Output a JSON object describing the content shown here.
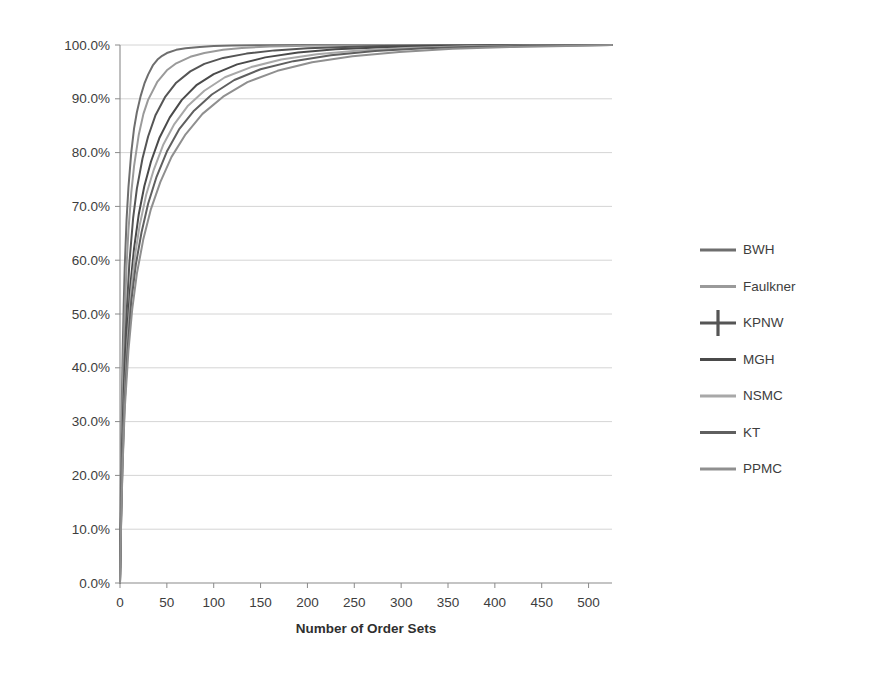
{
  "chart_data": {
    "type": "line",
    "title": "",
    "subtitle": "",
    "xlabel": "Number of Order Sets",
    "ylabel": "",
    "xlim": [
      0,
      525
    ],
    "ylim": [
      0,
      1.0
    ],
    "grid": "horizontal",
    "legend_position": "right",
    "x_ticks": [
      0,
      50,
      100,
      150,
      200,
      250,
      300,
      350,
      400,
      450,
      500
    ],
    "x_tick_labels": [
      "0",
      "50",
      "100",
      "150",
      "200",
      "250",
      "300",
      "350",
      "400",
      "450",
      "500"
    ],
    "y_ticks": [
      0.0,
      0.1,
      0.2,
      0.3,
      0.4,
      0.5,
      0.6,
      0.7,
      0.8,
      0.9,
      1.0
    ],
    "y_tick_labels": [
      "0.0%",
      "10.0%",
      "20.0%",
      "30.0%",
      "40.0%",
      "50.0%",
      "60.0%",
      "70.0%",
      "80.0%",
      "90.0%",
      "100.0%"
    ],
    "series": [
      {
        "name": "BWH",
        "color": "#6e6e6e",
        "marker": "none",
        "x": [
          0,
          1,
          2,
          3,
          4,
          5,
          7,
          9,
          12,
          15,
          18,
          22,
          26,
          30,
          35,
          40,
          45,
          50,
          60,
          70,
          85,
          100,
          120,
          150,
          200,
          250,
          300,
          400,
          500,
          525
        ],
        "y": [
          0.0,
          0.2,
          0.34,
          0.44,
          0.52,
          0.585,
          0.675,
          0.735,
          0.8,
          0.845,
          0.875,
          0.905,
          0.928,
          0.945,
          0.962,
          0.973,
          0.98,
          0.985,
          0.991,
          0.994,
          0.9965,
          0.998,
          0.9989,
          0.9995,
          0.9999,
          1.0,
          1.0,
          1.0,
          1.0,
          1.0
        ]
      },
      {
        "name": "Faulkner",
        "color": "#9a9a9a",
        "marker": "none",
        "x": [
          0,
          1,
          2,
          3,
          4,
          5,
          7,
          9,
          12,
          15,
          20,
          25,
          30,
          40,
          50,
          60,
          75,
          90,
          110,
          130,
          160,
          200,
          250,
          300,
          400,
          500,
          525
        ],
        "y": [
          0.0,
          0.16,
          0.275,
          0.365,
          0.44,
          0.5,
          0.59,
          0.655,
          0.725,
          0.775,
          0.833,
          0.872,
          0.898,
          0.932,
          0.953,
          0.966,
          0.978,
          0.985,
          0.991,
          0.9945,
          0.9972,
          0.9988,
          0.9996,
          0.9999,
          1.0,
          1.0,
          1.0
        ]
      },
      {
        "name": "KPNW",
        "color": "#555555",
        "marker": "cross",
        "x": [
          0,
          1,
          2,
          3,
          5,
          7,
          10,
          14,
          18,
          24,
          30,
          38,
          48,
          60,
          75,
          90,
          110,
          135,
          165,
          200,
          240,
          280,
          330,
          400,
          470,
          525
        ],
        "y": [
          0.0,
          0.13,
          0.225,
          0.3,
          0.415,
          0.5,
          0.595,
          0.678,
          0.733,
          0.789,
          0.83,
          0.87,
          0.903,
          0.93,
          0.951,
          0.965,
          0.976,
          0.984,
          0.99,
          0.994,
          0.9965,
          0.998,
          0.999,
          0.9997,
          0.9999,
          1.0
        ]
      },
      {
        "name": "MGH",
        "color": "#4a4a4a",
        "marker": "none",
        "x": [
          0,
          1,
          2,
          3,
          5,
          8,
          11,
          15,
          20,
          26,
          33,
          42,
          53,
          66,
          82,
          100,
          125,
          155,
          190,
          230,
          275,
          330,
          400,
          470,
          525
        ],
        "y": [
          0.0,
          0.115,
          0.2,
          0.27,
          0.375,
          0.478,
          0.553,
          0.622,
          0.685,
          0.738,
          0.783,
          0.827,
          0.865,
          0.898,
          0.926,
          0.946,
          0.964,
          0.977,
          0.986,
          0.992,
          0.9955,
          0.998,
          0.9993,
          0.9998,
          1.0
        ]
      },
      {
        "name": "NSMC",
        "color": "#a8a8a8",
        "marker": "none",
        "x": [
          0,
          1,
          2,
          3,
          5,
          8,
          12,
          16,
          21,
          28,
          36,
          46,
          58,
          72,
          90,
          112,
          140,
          172,
          210,
          255,
          305,
          370,
          440,
          525
        ],
        "y": [
          0.0,
          0.105,
          0.185,
          0.25,
          0.35,
          0.452,
          0.545,
          0.608,
          0.665,
          0.722,
          0.768,
          0.814,
          0.853,
          0.886,
          0.915,
          0.94,
          0.959,
          0.973,
          0.983,
          0.99,
          0.9945,
          0.9975,
          0.9991,
          1.0
        ]
      },
      {
        "name": "KT",
        "color": "#5f5f5f",
        "marker": "none",
        "x": [
          0,
          1,
          2,
          3,
          5,
          8,
          12,
          17,
          23,
          30,
          39,
          50,
          63,
          79,
          98,
          122,
          150,
          185,
          225,
          272,
          325,
          390,
          460,
          525
        ],
        "y": [
          0.0,
          0.1,
          0.175,
          0.238,
          0.335,
          0.432,
          0.523,
          0.593,
          0.652,
          0.705,
          0.755,
          0.802,
          0.843,
          0.878,
          0.908,
          0.935,
          0.955,
          0.97,
          0.981,
          0.989,
          0.9938,
          0.9972,
          0.999,
          1.0
        ]
      },
      {
        "name": "PPMC",
        "color": "#8f8f8f",
        "marker": "none",
        "x": [
          0,
          1,
          2,
          3,
          5,
          9,
          13,
          18,
          25,
          33,
          43,
          55,
          70,
          88,
          110,
          136,
          168,
          205,
          248,
          298,
          355,
          420,
          490,
          525
        ],
        "y": [
          0.0,
          0.095,
          0.168,
          0.228,
          0.322,
          0.432,
          0.508,
          0.575,
          0.64,
          0.695,
          0.745,
          0.792,
          0.834,
          0.872,
          0.904,
          0.931,
          0.952,
          0.968,
          0.979,
          0.987,
          0.9928,
          0.9965,
          0.9988,
          1.0
        ]
      }
    ]
  },
  "legend": {
    "items": [
      {
        "label": "BWH"
      },
      {
        "label": "Faulkner"
      },
      {
        "label": "KPNW"
      },
      {
        "label": "MGH"
      },
      {
        "label": "NSMC"
      },
      {
        "label": "KT"
      },
      {
        "label": "PPMC"
      }
    ]
  },
  "style": {
    "background": "#ffffff",
    "gridline_color": "#c9c9c9",
    "axis_color": "#8a8a8a",
    "text_color": "#3d3d3d"
  }
}
